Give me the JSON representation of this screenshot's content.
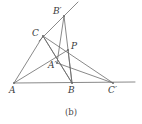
{
  "figure": {
    "caption": "(b)",
    "caption_x": 0,
    "caption_y": 108,
    "width": 142,
    "height": 124,
    "background_color": "#ffffff",
    "stroke_color": "#6b6b6b",
    "label_color": "#3b3b3b",
    "stroke_width": 0.8
  },
  "points": [
    {
      "id": "A",
      "label": "A",
      "x": 14,
      "y": 83,
      "label_x": 9,
      "label_y": 86
    },
    {
      "id": "B",
      "label": "B",
      "x": 72,
      "y": 83,
      "label_x": 68,
      "label_y": 86
    },
    {
      "id": "C",
      "label": "C",
      "x": 43,
      "y": 36,
      "label_x": 32,
      "label_y": 29
    },
    {
      "id": "P",
      "label": "P",
      "x": 68,
      "y": 50,
      "label_x": 71,
      "label_y": 42
    },
    {
      "id": "Ap",
      "label": "A′",
      "x": 57,
      "y": 63,
      "label_x": 48,
      "label_y": 61
    },
    {
      "id": "Bp",
      "label": "B′",
      "x": 64,
      "y": 16,
      "label_x": 53,
      "label_y": 7
    },
    {
      "id": "Cp",
      "label": "C′",
      "x": 113,
      "y": 83,
      "label_x": 108,
      "label_y": 86
    }
  ],
  "segments": [
    {
      "name": "base-line-A-to-right-end",
      "x1": 14,
      "y1": 83,
      "x2": 135,
      "y2": 82
    },
    {
      "name": "side-A-to-C",
      "x1": 14,
      "y1": 83,
      "x2": 43,
      "y2": 36
    },
    {
      "name": "side-C-to-B",
      "x1": 43,
      "y1": 36,
      "x2": 72,
      "y2": 83
    },
    {
      "name": "cevian-A-through-Aprime-to-P",
      "x1": 14,
      "y1": 83,
      "x2": 68,
      "y2": 50
    },
    {
      "name": "cevian-C-through-P-to-Cprime",
      "x1": 43,
      "y1": 36,
      "x2": 113,
      "y2": 83
    },
    {
      "name": "line-C-to-Bprime-extended",
      "x1": 39,
      "y1": 41,
      "x2": 78,
      "y2": 2
    },
    {
      "name": "cevian-Bprime-through-P-to-B",
      "x1": 64,
      "y1": 16,
      "x2": 72,
      "y2": 83
    },
    {
      "name": "segment-C-to-Aprime-to-B",
      "x1": 43,
      "y1": 36,
      "x2": 72,
      "y2": 83
    },
    {
      "name": "segment-Bprime-to-Aprime",
      "x1": 64,
      "y1": 16,
      "x2": 57,
      "y2": 63
    },
    {
      "name": "segment-P-to-B",
      "x1": 68,
      "y1": 50,
      "x2": 72,
      "y2": 83
    },
    {
      "name": "segment-Aprime-to-Cprime",
      "x1": 57,
      "y1": 63,
      "x2": 113,
      "y2": 83
    }
  ]
}
